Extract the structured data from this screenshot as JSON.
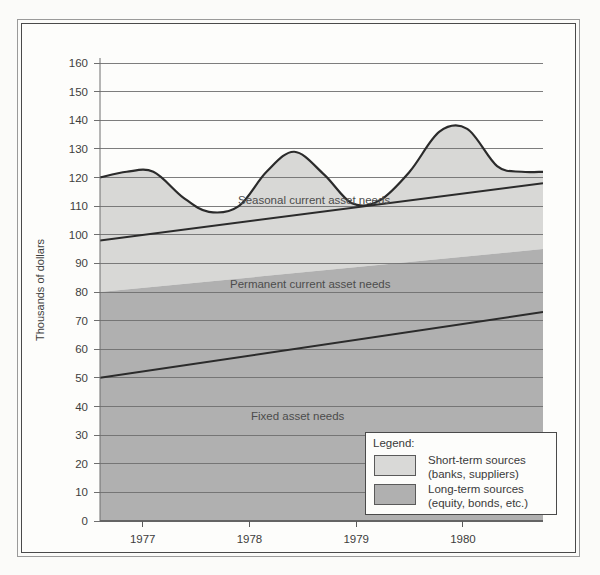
{
  "chart_data": {
    "type": "area",
    "title": "",
    "xlabel": "",
    "ylabel": "Thousands of dollars",
    "ylim": [
      0,
      165
    ],
    "xlim": [
      1976.6,
      1980.75
    ],
    "grid": true,
    "y_ticks": [
      0,
      10,
      20,
      30,
      40,
      50,
      60,
      70,
      80,
      90,
      100,
      110,
      120,
      130,
      140,
      150,
      160
    ],
    "x_ticks": [
      1977,
      1978,
      1979,
      1980
    ],
    "x_tick_labels": [
      "1977",
      "1978",
      "1979",
      "1980"
    ],
    "series": [
      {
        "name": "Fixed asset needs",
        "kind": "line",
        "label": "Fixed asset needs",
        "x": [
          1976.6,
          1980.75
        ],
        "values": [
          50,
          73
        ]
      },
      {
        "name": "Permanent current asset needs",
        "kind": "line",
        "label": "Permanent current asset needs",
        "x": [
          1976.6,
          1980.75
        ],
        "values": [
          98,
          118
        ]
      },
      {
        "name": "Seasonal current asset needs",
        "kind": "wave",
        "label": "Seasonal current asset needs",
        "x": [
          1976.6,
          1976.85,
          1977.1,
          1977.38,
          1977.62,
          1977.9,
          1978.16,
          1978.42,
          1978.7,
          1978.96,
          1979.22,
          1979.5,
          1979.78,
          1980.04,
          1980.32,
          1980.55,
          1980.75
        ],
        "values": [
          120,
          122,
          122,
          113,
          108,
          110,
          122,
          129,
          121,
          111,
          112,
          122,
          136,
          137,
          124,
          122,
          122
        ]
      },
      {
        "name": "Long-term sources boundary",
        "kind": "line",
        "x": [
          1976.6,
          1980.75
        ],
        "values": [
          80,
          95
        ]
      }
    ],
    "bands": [
      {
        "name": "short-term-sources",
        "color": "#d8d8d6",
        "legend": "Short-term sources (banks, suppliers)"
      },
      {
        "name": "long-term-sources",
        "color": "#b0b0b0",
        "legend": "Long-term sources (equity, bonds, etc.)"
      }
    ]
  },
  "axis": {
    "y_title": "Thousands of dollars",
    "y_ticks": [
      "160",
      "150",
      "140",
      "130",
      "120",
      "110",
      "100",
      "90",
      "80",
      "70",
      "60",
      "50",
      "40",
      "30",
      "20",
      "10",
      "0"
    ],
    "x_ticks": [
      "1977",
      "1978",
      "1979",
      "1980"
    ]
  },
  "labels": {
    "seasonal": "Seasonal current asset needs",
    "permanent": "Permanent current asset needs",
    "fixed": "Fixed asset needs"
  },
  "legend": {
    "title": "Legend:",
    "items": [
      {
        "swatch_color": "#d9d9d7",
        "line1": "Short-term sources",
        "line2": "(banks, suppliers)"
      },
      {
        "swatch_color": "#b0b0b0",
        "line1": "Long-term sources",
        "line2": "(equity, bonds, etc.)"
      }
    ]
  },
  "colors": {
    "page_background": "#fbfbf9",
    "plot_background": "#fdfdfb",
    "short_term_fill": "#d8d8d6",
    "long_term_fill": "#b0b0b0",
    "gridline": "#6f6f6f",
    "curve_stroke": "#2b2b2b",
    "frame_stroke": "#4a4a4a"
  }
}
